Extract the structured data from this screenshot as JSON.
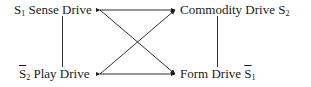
{
  "diagram": {
    "nodes": [
      {
        "id": "sense",
        "symbol": "S",
        "sub": "1",
        "overline": false,
        "label": "Sense Drive",
        "position": "top-left"
      },
      {
        "id": "commodity",
        "symbol": "S",
        "sub": "2",
        "overline": false,
        "label": "Commodity Drive",
        "position": "top-right"
      },
      {
        "id": "play",
        "symbol": "S",
        "sub": "2",
        "overline": true,
        "label": "Play Drive",
        "position": "bottom-left"
      },
      {
        "id": "form",
        "symbol": "S",
        "sub": "1",
        "overline": true,
        "label": "Form Drive",
        "position": "bottom-right"
      }
    ],
    "edges": [
      {
        "from": "commodity",
        "to": "sense",
        "type": "arrow"
      },
      {
        "from": "form",
        "to": "play",
        "type": "double-arrow"
      },
      {
        "from": "sense",
        "to": "play",
        "type": "line"
      },
      {
        "from": "commodity",
        "to": "form",
        "type": "line"
      },
      {
        "from": "sense",
        "to": "form",
        "type": "diagonal-arrow"
      },
      {
        "from": "play",
        "to": "commodity",
        "type": "diagonal-arrow"
      }
    ],
    "colors": {
      "ink": "#1a1a1a",
      "background": "#ffffff"
    }
  }
}
